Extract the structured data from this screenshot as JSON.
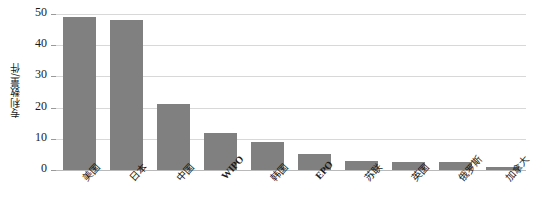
{
  "chart_data": {
    "type": "bar",
    "title": "",
    "xlabel": "",
    "ylabel": "专利数量/件",
    "categories": [
      "美国",
      "日本",
      "中国",
      "WIPO",
      "韩国",
      "EPO",
      "苏联",
      "英国",
      "俄罗斯",
      "加拿大"
    ],
    "values": [
      49,
      48,
      21,
      12,
      9,
      5,
      3,
      2.5,
      2.5,
      1
    ],
    "ylim": [
      0,
      50
    ],
    "yticks": [
      0,
      10,
      20,
      30,
      40,
      50
    ],
    "ytick_labels": [
      "0",
      "10",
      "20",
      "30",
      "40",
      "50"
    ],
    "grid": true,
    "legend": false,
    "bar_color": "#808080",
    "grid_color": "#d8d8d8",
    "axis_color": "#b9b9b9",
    "text_color": "#1a1a1a"
  }
}
